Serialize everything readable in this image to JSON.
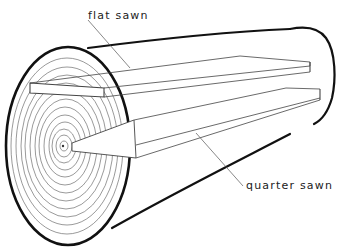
{
  "diagram": {
    "labels": {
      "flat_sawn": "flat sawn",
      "quarter_sawn": "quarter sawn"
    },
    "colors": {
      "background": "#ffffff",
      "outline": "#111111",
      "rings": "#555555",
      "boards": "#444444",
      "leader": "#555555"
    }
  }
}
